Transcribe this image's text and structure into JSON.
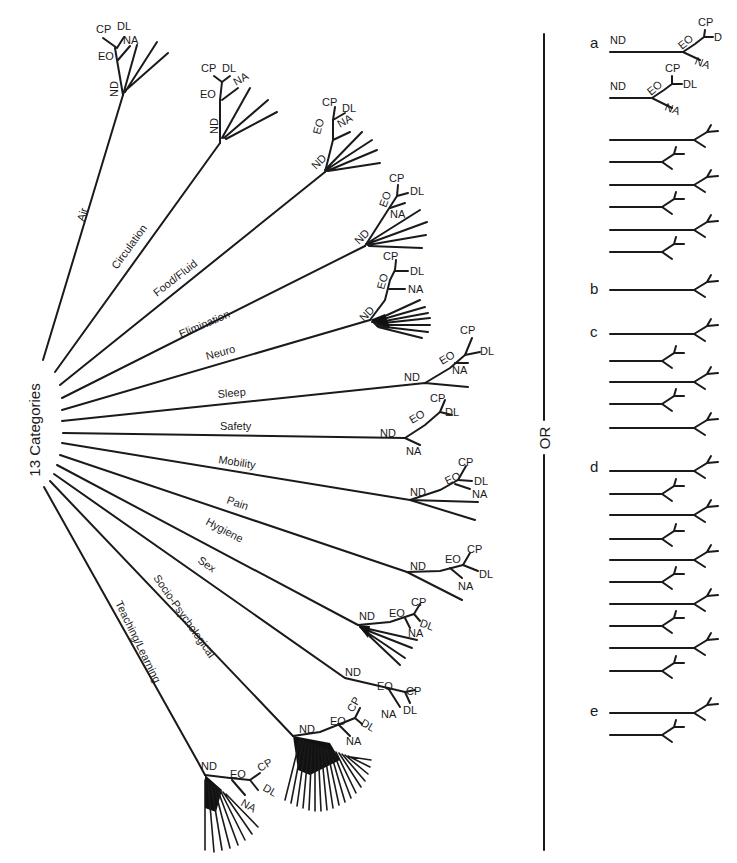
{
  "diagram": {
    "title": "13 Categories",
    "separator_label": "OR",
    "node_labels": {
      "nd": "ND",
      "eo": "EO",
      "cp": "CP",
      "dl": "DL",
      "na": "NA"
    },
    "categories": [
      {
        "label": "Air",
        "subbranches": 4
      },
      {
        "label": "Circulation",
        "subbranches": 4
      },
      {
        "label": "Food/Fluid",
        "subbranches": 5
      },
      {
        "label": "Elimination",
        "subbranches": 5
      },
      {
        "label": "Neuro",
        "subbranches": 7
      },
      {
        "label": "Sleep",
        "subbranches": 2
      },
      {
        "label": "Safety",
        "subbranches": 1
      },
      {
        "label": "Mobility",
        "subbranches": 3
      },
      {
        "label": "Pain",
        "subbranches": 2
      },
      {
        "label": "Hygiene",
        "subbranches": 5
      },
      {
        "label": "Sex",
        "subbranches": 1
      },
      {
        "label": "Socio-Psychological",
        "subbranches": 18
      },
      {
        "label": "Teaching/Learning",
        "subbranches": 10
      }
    ],
    "alternatives": [
      {
        "letter": "a",
        "first_row_labels": {
          "nd": "ND",
          "eo": "EO",
          "cp": "CP",
          "dl": "D",
          "na": "NA"
        },
        "second_row_labels": {
          "nd": "ND",
          "eo": "EO",
          "cp": "CP",
          "dl": "DL",
          "na": "NA"
        },
        "rows": 8
      },
      {
        "letter": "b",
        "rows": 1
      },
      {
        "letter": "c",
        "rows": 5
      },
      {
        "letter": "d",
        "rows": 10
      },
      {
        "letter": "e",
        "rows": 2
      }
    ]
  }
}
